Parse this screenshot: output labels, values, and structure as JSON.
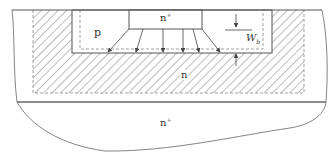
{
  "diagram": {
    "labels": {
      "p_region": "p",
      "n_plus_top": "n",
      "n_plus_top_sup": "+",
      "n_region": "n",
      "n_plus_bottom": "n",
      "n_plus_bottom_sup": "+",
      "width_symbol": "W",
      "width_subscript": "b"
    },
    "colors": {
      "line": "#555555",
      "hatch": "#666666",
      "dashed": "#888888",
      "background": "#ffffff"
    },
    "regions": [
      {
        "name": "n+ emitter",
        "label": "n+"
      },
      {
        "name": "p base",
        "label": "p"
      },
      {
        "name": "n collector (depletion, hatched)",
        "label": "n"
      },
      {
        "name": "n+ substrate",
        "label": "n+"
      }
    ],
    "arrows_count": 6
  }
}
